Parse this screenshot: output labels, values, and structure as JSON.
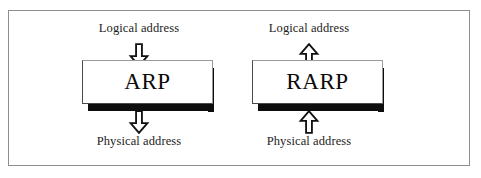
{
  "figure": {
    "caption_remnant": "",
    "frame_color": "#8e8e92",
    "background": "#ffffff",
    "box_fill": "#ffffff",
    "box_border_color": "#4a4a4a",
    "shadow_color": "#0d0d0d",
    "text_color": "#1c1c1c"
  },
  "columns": [
    {
      "id": "arp",
      "name": "ARP",
      "top_label": "Logical address",
      "bottom_label": "Physical address",
      "top_arrow": "arrow-down-icon",
      "bottom_arrow": "arrow-down-icon",
      "direction": "logical-to-physical"
    },
    {
      "id": "rarp",
      "name": "RARP",
      "top_label": "Logical address",
      "bottom_label": "Physical address",
      "top_arrow": "arrow-up-icon",
      "bottom_arrow": "arrow-up-icon",
      "direction": "physical-to-logical"
    }
  ]
}
